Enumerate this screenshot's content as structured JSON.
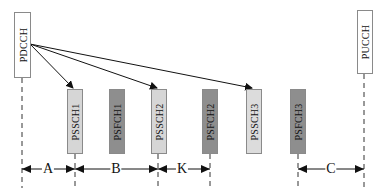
{
  "diagram": {
    "title": "",
    "colors": {
      "pscch_fill": "#d6d6d6",
      "psfch_fill": "#8e8e8e",
      "control_fill": "#ffffff",
      "line": "#111111",
      "border": "#8a8a8a"
    },
    "channels": [
      {
        "id": "pdcch",
        "label": "PDCCH",
        "type": "control"
      },
      {
        "id": "pssch1",
        "label": "PSSCH1",
        "type": "pssch"
      },
      {
        "id": "psfch1",
        "label": "PSFCH1",
        "type": "psfch"
      },
      {
        "id": "pssch2",
        "label": "PSSCH2",
        "type": "pssch"
      },
      {
        "id": "psfch2",
        "label": "PSFCH2",
        "type": "psfch"
      },
      {
        "id": "pssch3",
        "label": "PSSCH3",
        "type": "pssch"
      },
      {
        "id": "psfch3",
        "label": "PSFCH3",
        "type": "psfch"
      },
      {
        "id": "pucch",
        "label": "PUCCH",
        "type": "control"
      }
    ],
    "scheduling_arrows": [
      {
        "from": "PDCCH",
        "to": "PSSCH1"
      },
      {
        "from": "PDCCH",
        "to": "PSSCH2"
      },
      {
        "from": "PDCCH",
        "to": "PSSCH3"
      }
    ],
    "intervals": [
      {
        "label": "A",
        "from": "PDCCH",
        "to": "PSSCH1"
      },
      {
        "label": "B",
        "from": "PSSCH1",
        "to": "PSSCH2"
      },
      {
        "label": "K",
        "from": "PSSCH2",
        "to": "PSFCH2"
      },
      {
        "label": "C",
        "from": "PSFCH3",
        "to": "PUCCH"
      }
    ]
  }
}
